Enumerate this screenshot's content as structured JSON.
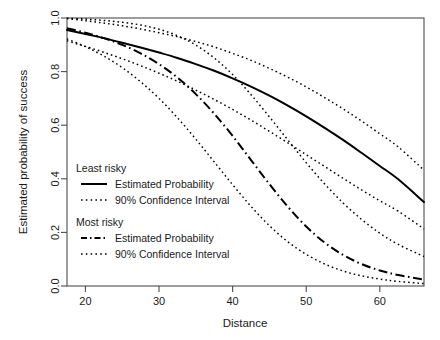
{
  "chart_data": {
    "type": "line",
    "title": "",
    "xlabel": "Distance",
    "ylabel": "Estimated probability of success",
    "xlim": [
      17.5,
      66.0
    ],
    "ylim": [
      0.0,
      1.0
    ],
    "grid": false,
    "legend_position": "center-left",
    "xticks": [
      "20",
      "30",
      "40",
      "50",
      "60"
    ],
    "xtick_values": [
      20,
      30,
      40,
      50,
      60
    ],
    "yticks": [
      "0.0",
      "0.2",
      "0.4",
      "0.6",
      "0.8",
      "1.0"
    ],
    "ytick_values": [
      0.0,
      0.2,
      0.4,
      0.6,
      0.8,
      1.0
    ],
    "x": [
      17.5,
      20,
      22.5,
      25,
      27.5,
      30,
      32.5,
      35,
      37.5,
      40,
      42.5,
      45,
      47.5,
      50,
      52.5,
      55,
      57.5,
      60,
      62.5,
      66
    ],
    "series": [
      {
        "name": "Least risky - Estimated Probability",
        "group": "Least risky",
        "role": "estimate",
        "style": "solid",
        "values": [
          0.955,
          0.94,
          0.925,
          0.908,
          0.89,
          0.871,
          0.851,
          0.828,
          0.803,
          0.775,
          0.744,
          0.71,
          0.673,
          0.633,
          0.59,
          0.545,
          0.497,
          0.448,
          0.398,
          0.313
        ]
      },
      {
        "name": "Least risky - 90% CI upper",
        "group": "Least risky",
        "role": "ci-upper",
        "style": "dotted",
        "values": [
          0.998,
          0.99,
          0.981,
          0.971,
          0.959,
          0.945,
          0.93,
          0.912,
          0.892,
          0.868,
          0.842,
          0.812,
          0.779,
          0.743,
          0.703,
          0.661,
          0.616,
          0.568,
          0.519,
          0.432
        ]
      },
      {
        "name": "Least risky - 90% CI lower",
        "group": "Least risky",
        "role": "ci-lower",
        "style": "dotted",
        "values": [
          0.915,
          0.894,
          0.872,
          0.848,
          0.822,
          0.794,
          0.764,
          0.731,
          0.696,
          0.659,
          0.619,
          0.577,
          0.534,
          0.49,
          0.446,
          0.402,
          0.359,
          0.318,
          0.279,
          0.213
        ]
      },
      {
        "name": "Most risky - Estimated Probability",
        "group": "Most risky",
        "role": "estimate",
        "style": "dashdot",
        "values": [
          0.962,
          0.945,
          0.925,
          0.9,
          0.868,
          0.828,
          0.778,
          0.716,
          0.643,
          0.56,
          0.47,
          0.38,
          0.296,
          0.222,
          0.162,
          0.116,
          0.082,
          0.058,
          0.041,
          0.024
        ]
      },
      {
        "name": "Most risky - 90% CI upper",
        "group": "Most risky",
        "role": "ci-upper",
        "style": "dotted",
        "values": [
          0.999,
          0.996,
          0.991,
          0.984,
          0.974,
          0.958,
          0.934,
          0.899,
          0.851,
          0.789,
          0.714,
          0.631,
          0.545,
          0.46,
          0.381,
          0.31,
          0.249,
          0.197,
          0.155,
          0.11
        ]
      },
      {
        "name": "Most risky - 90% CI lower",
        "group": "Most risky",
        "role": "ci-lower",
        "style": "dotted",
        "values": [
          0.922,
          0.893,
          0.858,
          0.815,
          0.762,
          0.7,
          0.628,
          0.548,
          0.463,
          0.378,
          0.297,
          0.225,
          0.165,
          0.118,
          0.082,
          0.056,
          0.038,
          0.026,
          0.017,
          0.009
        ]
      }
    ],
    "legend": {
      "groups": [
        {
          "header": "Least risky",
          "entries": [
            {
              "label": "Estimated Probability",
              "style": "solid"
            },
            {
              "label": "90% Confidence Interval",
              "style": "dotted"
            }
          ]
        },
        {
          "header": "Most risky",
          "entries": [
            {
              "label": "Estimated Probability",
              "style": "dashdot"
            },
            {
              "label": "90% Confidence Interval",
              "style": "dotted"
            }
          ]
        }
      ]
    },
    "colors": {
      "line": "#000000",
      "axis": "#4d4d4d",
      "text": "#1a1a1a",
      "background": "#ffffff"
    }
  }
}
